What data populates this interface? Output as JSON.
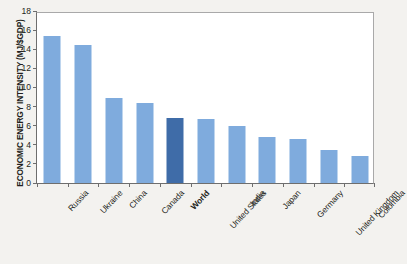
{
  "chart_data": {
    "type": "bar",
    "title": "",
    "xlabel": "",
    "ylabel": "ECONOMIC ENERGY INTENSITY (MJ/$GDP)",
    "ylim": [
      0,
      18
    ],
    "yticks": [
      0,
      2,
      4,
      6,
      8,
      10,
      12,
      14,
      16,
      18
    ],
    "ytick_labels": [
      "0",
      "2",
      "4",
      "6",
      "8",
      "10",
      "12",
      "14",
      "16",
      "18"
    ],
    "grid": false,
    "legend": "none",
    "categories": [
      "Russia",
      "Ukraine",
      "China",
      "Canada",
      "World",
      "United States",
      "India",
      "Japan",
      "Germany",
      "United Kingdom",
      "Colombia"
    ],
    "values": [
      15.4,
      14.4,
      8.85,
      8.4,
      6.85,
      6.65,
      6.0,
      4.85,
      4.6,
      3.45,
      2.85
    ],
    "highlight_category": "World",
    "colors": {
      "bar": "#7fabdd",
      "bar_highlight": "#3f6ca8",
      "axis": "#6e6e6e",
      "frame": "#a9a9a9",
      "text": "#231f20",
      "plot_background": "#ffffff",
      "figure_background": "#f3f2ef"
    }
  }
}
